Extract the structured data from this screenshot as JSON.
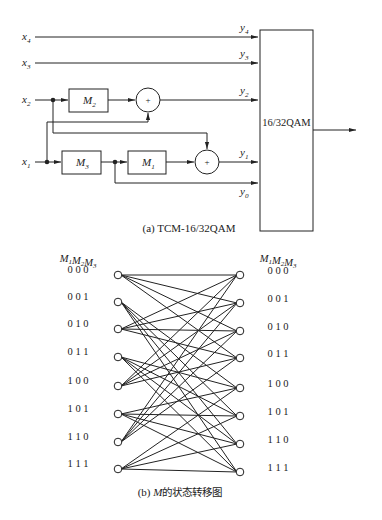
{
  "figure_a": {
    "caption": "(a) TCM-16/32QAM",
    "inputs": [
      {
        "name": "x4",
        "base": "x",
        "sub": "4"
      },
      {
        "name": "x3",
        "base": "x",
        "sub": "3"
      },
      {
        "name": "x2",
        "base": "x",
        "sub": "2"
      },
      {
        "name": "x1",
        "base": "x",
        "sub": "1"
      }
    ],
    "outputs": [
      {
        "name": "y4",
        "base": "y",
        "sub": "4"
      },
      {
        "name": "y3",
        "base": "y",
        "sub": "3"
      },
      {
        "name": "y2",
        "base": "y",
        "sub": "2"
      },
      {
        "name": "y1",
        "base": "y",
        "sub": "1"
      },
      {
        "name": "y0",
        "base": "y",
        "sub": "0"
      }
    ],
    "delays": [
      {
        "name": "M2",
        "base": "M",
        "sub": "2"
      },
      {
        "name": "M3",
        "base": "M",
        "sub": "3"
      },
      {
        "name": "M1",
        "base": "M",
        "sub": "1"
      }
    ],
    "adder_symbol": "+",
    "mapper_label": "16/32QAM"
  },
  "figure_b": {
    "caption_prefix": "(b) ",
    "caption_var": "M",
    "caption_suffix": "的状态转移图",
    "header_left": {
      "parts": [
        {
          "base": "M",
          "sub": "1"
        },
        {
          "base": "M",
          "sub": "2"
        },
        {
          "base": "M",
          "sub": "3"
        }
      ]
    },
    "header_right": {
      "parts": [
        {
          "base": "M",
          "sub": "1"
        },
        {
          "base": "M",
          "sub": "2"
        },
        {
          "base": "M",
          "sub": "3"
        }
      ]
    },
    "states": [
      "0 0 0",
      "0 0 1",
      "0 1 0",
      "0 1 1",
      "1 0 0",
      "1 0 1",
      "1 1 0",
      "1 1 1"
    ],
    "transitions": [
      [
        0,
        [
          0,
          1,
          2,
          3
        ]
      ],
      [
        1,
        [
          4,
          5,
          6,
          7
        ]
      ],
      [
        2,
        [
          0,
          1,
          2,
          3
        ]
      ],
      [
        3,
        [
          4,
          5,
          6,
          7
        ]
      ],
      [
        4,
        [
          0,
          1,
          2,
          3
        ]
      ],
      [
        5,
        [
          4,
          5,
          6,
          7
        ]
      ],
      [
        6,
        [
          0,
          1,
          2,
          3
        ]
      ],
      [
        7,
        [
          4,
          5,
          6,
          7
        ]
      ]
    ]
  }
}
